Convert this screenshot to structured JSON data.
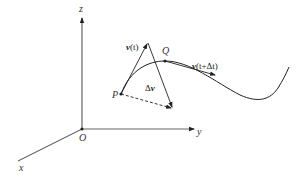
{
  "axes": {
    "origin_label": "O",
    "x_label": "x",
    "y_label": "y",
    "z_label": "z"
  },
  "points": {
    "P": "P",
    "Q": "Q"
  },
  "vectors": {
    "v_t_bold": "v",
    "v_t_arg": "(t)",
    "v_tdt_bold": "v",
    "v_tdt_arg": "(t+Δt)",
    "delta_prefix": "Δ",
    "delta_bold": "v"
  },
  "colors": {
    "line": "#222222",
    "axis": "#333333",
    "background": "#ffffff"
  }
}
